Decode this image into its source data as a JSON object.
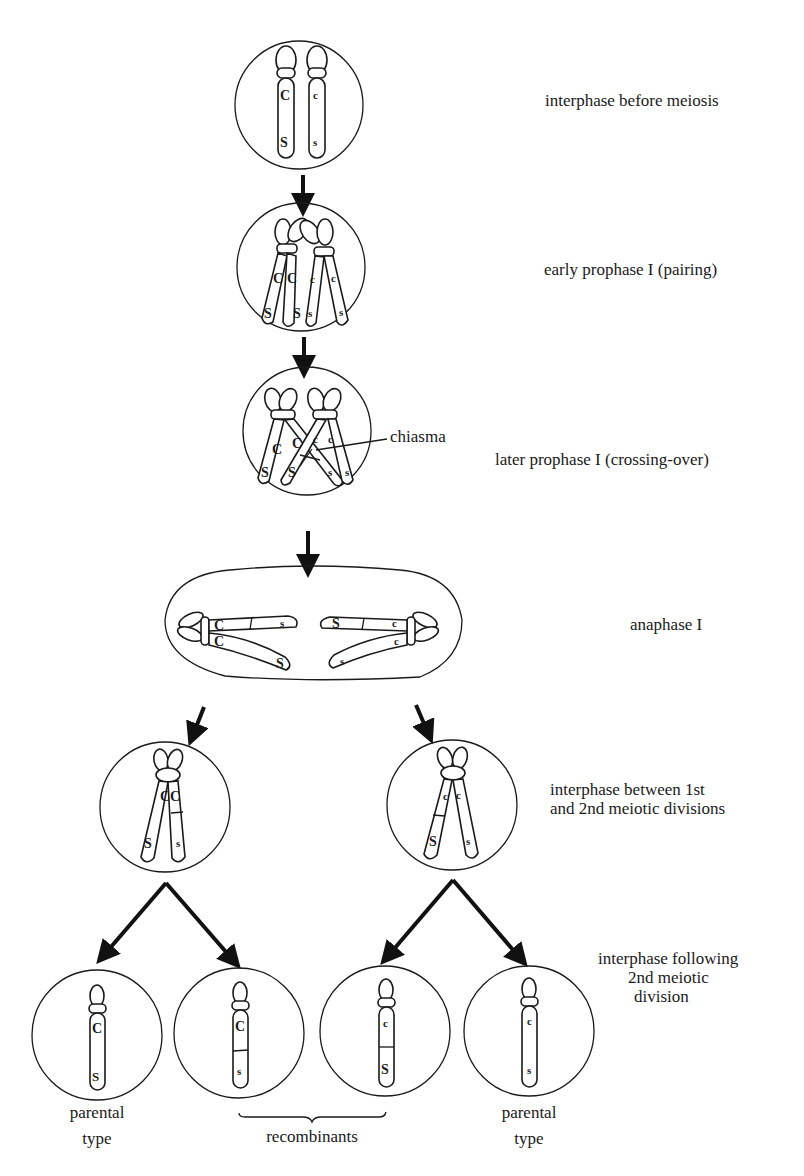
{
  "stages": [
    {
      "id": "interphase-before-meiosis",
      "label": "interphase before meiosis"
    },
    {
      "id": "early-prophase-1",
      "label": "early prophase I (pairing)"
    },
    {
      "id": "later-prophase-1",
      "label": "later prophase I (crossing-over)"
    },
    {
      "id": "anaphase-1",
      "label": "anaphase I"
    },
    {
      "id": "interphase-between",
      "label_line1": "interphase between 1st",
      "label_line2": "and 2nd meiotic divisions"
    },
    {
      "id": "interphase-following",
      "label_line1": "interphase following",
      "label_line2": "2nd meiotic",
      "label_line3": "division"
    }
  ],
  "annotations": {
    "chiasma": "chiasma"
  },
  "genes": {
    "C_dom": "C",
    "c_rec": "c",
    "S_dom": "S",
    "s_rec": "s"
  },
  "products": [
    {
      "genotype": [
        "C",
        "S"
      ],
      "type": "parental"
    },
    {
      "genotype": [
        "C",
        "s"
      ],
      "type": "recombinant"
    },
    {
      "genotype": [
        "c",
        "S"
      ],
      "type": "recombinant"
    },
    {
      "genotype": [
        "c",
        "s"
      ],
      "type": "parental"
    }
  ],
  "bottom_labels": {
    "parental_left_1": "parental",
    "parental_left_2": "type",
    "recombinants": "recombinants",
    "parental_right_1": "parental",
    "parental_right_2": "type"
  }
}
